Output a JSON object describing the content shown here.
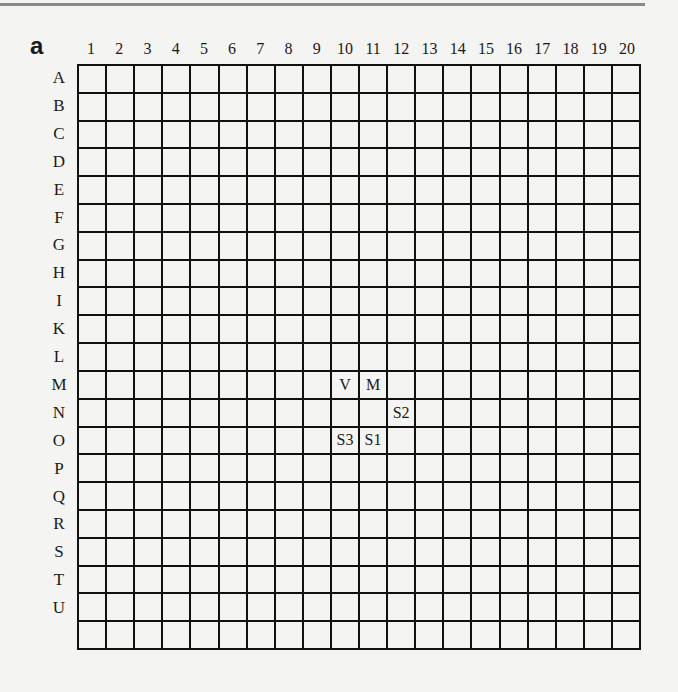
{
  "panel_label": "a",
  "columns": [
    "1",
    "2",
    "3",
    "4",
    "5",
    "6",
    "7",
    "8",
    "9",
    "10",
    "11",
    "12",
    "13",
    "14",
    "15",
    "16",
    "17",
    "18",
    "19",
    "20"
  ],
  "rows": [
    "A",
    "B",
    "C",
    "D",
    "E",
    "F",
    "G",
    "H",
    "I",
    "K",
    "L",
    "M",
    "N",
    "O",
    "P",
    "Q",
    "R",
    "S",
    "T",
    "U"
  ],
  "marks": [
    {
      "row": "M",
      "col": "10",
      "label": "V"
    },
    {
      "row": "M",
      "col": "11",
      "label": "M"
    },
    {
      "row": "N",
      "col": "12",
      "label": "S2"
    },
    {
      "row": "O",
      "col": "10",
      "label": "S3"
    },
    {
      "row": "O",
      "col": "11",
      "label": "S1"
    }
  ]
}
